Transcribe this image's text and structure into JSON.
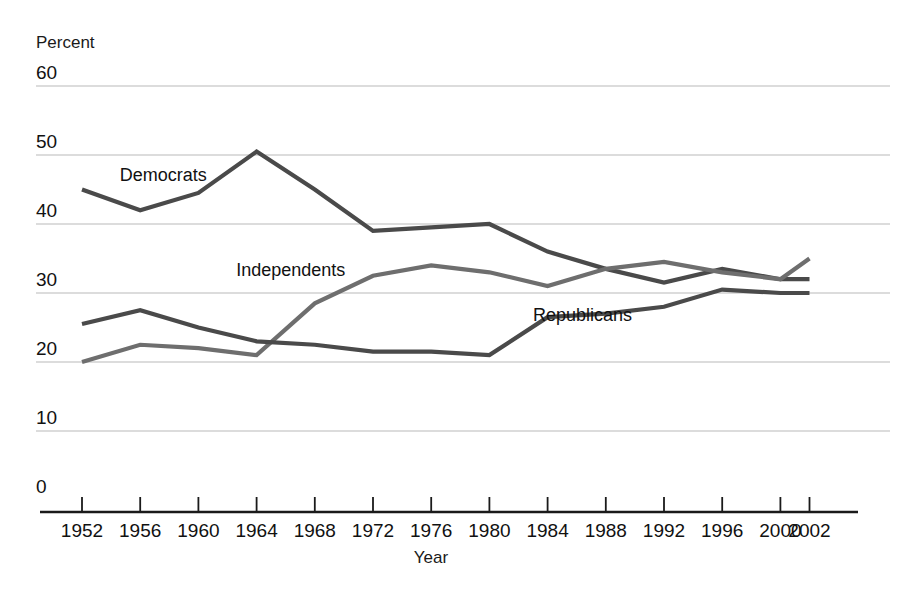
{
  "chart_data": {
    "type": "line",
    "title": "",
    "xlabel": "Year",
    "ylabel": "Percent",
    "ylim": [
      0,
      60
    ],
    "ytick_labels": [
      "0",
      "10",
      "20",
      "30",
      "40",
      "50",
      "60"
    ],
    "yticks": [
      0,
      10,
      20,
      30,
      40,
      50,
      60
    ],
    "grid": true,
    "legend_position": "inline-labels",
    "categories": [
      "1952",
      "1956",
      "1960",
      "1964",
      "1968",
      "1972",
      "1976",
      "1980",
      "1984",
      "1988",
      "1992",
      "1996",
      "2000",
      "2002"
    ],
    "x": [
      1952,
      1956,
      1960,
      1964,
      1968,
      1972,
      1976,
      1980,
      1984,
      1988,
      1992,
      1996,
      2000,
      2002
    ],
    "series": [
      {
        "name": "Democrats",
        "color": "#4a4a4a",
        "values": [
          45,
          42,
          44.5,
          50.5,
          45,
          39,
          39.5,
          40,
          36,
          33.5,
          31.5,
          33.5,
          32,
          32
        ]
      },
      {
        "name": "Independents",
        "color": "#6e6e6e",
        "values": [
          20,
          22.5,
          22,
          21,
          28.5,
          32.5,
          34,
          33,
          31,
          33.5,
          34.5,
          33,
          32,
          35
        ]
      },
      {
        "name": "Republicans",
        "color": "#4a4a4a",
        "values": [
          25.5,
          27.5,
          25,
          23,
          22.5,
          21.5,
          21.5,
          21,
          26.5,
          27,
          28,
          30.5,
          30,
          30
        ]
      }
    ],
    "annotations": [
      {
        "text": "Democrats",
        "x": 1954.6,
        "y": 46.2
      },
      {
        "text": "Independents",
        "x": 1962.6,
        "y": 32.4
      },
      {
        "text": "Republicans",
        "x": 1983.0,
        "y": 26.0
      }
    ]
  },
  "colors": {
    "background": "#ffffff",
    "gridline": "#b9b9b9",
    "axis": "#1a1a1a",
    "democrats": "#4a4a4a",
    "independents": "#6e6e6e",
    "republicans": "#4a4a4a"
  }
}
